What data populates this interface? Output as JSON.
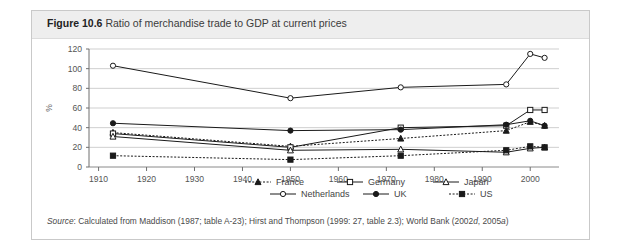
{
  "figure": {
    "number": "Figure 10.6",
    "caption": "Ratio of merchandise trade to GDP at current prices",
    "source_prefix": "Source",
    "source_text": ": Calculated from Maddison (1987; table A-23); Hirst and Thompson (1999: 27, table 2.3); World Bank (2002",
    "source_sub1": "d",
    "source_mid": ", 2005",
    "source_sub2": "a",
    "source_end": ")"
  },
  "chart_data": {
    "type": "line",
    "title": "Ratio of merchandise trade to GDP at current prices",
    "xlabel": "",
    "ylabel": "%",
    "xlim": [
      1908,
      2006
    ],
    "ylim": [
      0,
      120
    ],
    "ytick_step": 20,
    "yticks": [
      0,
      20,
      40,
      60,
      80,
      100,
      120
    ],
    "xticks": [
      1910,
      1920,
      1930,
      1940,
      1950,
      1960,
      1970,
      1980,
      1990,
      2000
    ],
    "grid": "horizontal",
    "legend_position": "bottom",
    "series": [
      {
        "name": "France",
        "line_style": "dotted",
        "marker": "triangle-filled",
        "color": "#1a1a1a",
        "x": [
          1913,
          1950,
          1973,
          1995,
          2000,
          2003
        ],
        "values": [
          35,
          21,
          29,
          37,
          46,
          42
        ]
      },
      {
        "name": "Germany",
        "line_style": "solid",
        "marker": "square-open",
        "color": "#1a1a1a",
        "x": [
          1913,
          1950,
          1973,
          1995,
          2000,
          2003
        ],
        "values": [
          34,
          20,
          40,
          42,
          58,
          58
        ]
      },
      {
        "name": "Japan",
        "line_style": "solid",
        "marker": "triangle-open",
        "color": "#1a1a1a",
        "x": [
          1913,
          1950,
          1973,
          1995,
          2000,
          2003
        ],
        "values": [
          31,
          17,
          18,
          15,
          19,
          20
        ]
      },
      {
        "name": "Netherlands",
        "line_style": "solid",
        "marker": "circle-open",
        "color": "#1a1a1a",
        "x": [
          1913,
          1950,
          1973,
          1995,
          2000,
          2003
        ],
        "values": [
          103,
          70,
          81,
          84,
          115,
          111
        ]
      },
      {
        "name": "UK",
        "line_style": "solid",
        "marker": "circle-filled",
        "color": "#1a1a1a",
        "x": [
          1913,
          1950,
          1973,
          1995,
          2000,
          2003
        ],
        "values": [
          44.5,
          37,
          38,
          43,
          47,
          42
        ]
      },
      {
        "name": "US",
        "line_style": "dotted",
        "marker": "square-filled",
        "color": "#1a1a1a",
        "x": [
          1913,
          1950,
          1973,
          1995,
          2000,
          2003
        ],
        "values": [
          11.5,
          7.5,
          11.5,
          17,
          21,
          20
        ]
      }
    ],
    "legend_rows": [
      [
        "France",
        "Germany",
        "Japan"
      ],
      [
        "Netherlands",
        "UK",
        "US"
      ]
    ]
  }
}
